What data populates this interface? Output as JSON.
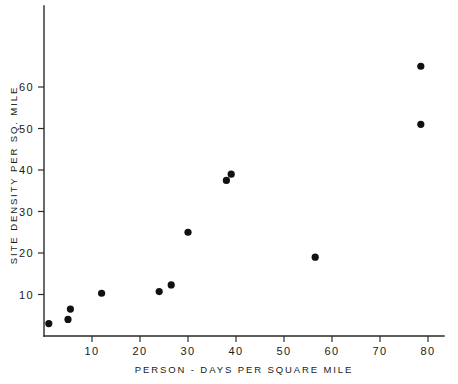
{
  "chart_data": {
    "type": "scatter",
    "title": "",
    "xlabel": "PERSON - DAYS  PER  SQUARE  MILE",
    "ylabel": "SITE  DENSITY  PER  SQ.  MILE",
    "xlim": [
      0,
      89
    ],
    "ylim": [
      0,
      70
    ],
    "xticks": [
      10,
      20,
      30,
      40,
      50,
      60,
      70,
      80
    ],
    "xtick_labels": [
      "10",
      "20",
      "30",
      "40",
      "50",
      "60",
      "70",
      "80"
    ],
    "yticks": [
      10,
      20,
      30,
      40,
      50,
      60
    ],
    "ytick_labels": [
      "10",
      "20",
      "30",
      "40",
      "50",
      "60"
    ],
    "grid": false,
    "legend": false,
    "marker": "filled-circle",
    "marker_color": "#111111",
    "points": [
      {
        "x": 1.0,
        "y": 3.0
      },
      {
        "x": 5.0,
        "y": 4.0
      },
      {
        "x": 5.5,
        "y": 6.5
      },
      {
        "x": 12.0,
        "y": 10.3
      },
      {
        "x": 24.0,
        "y": 10.7
      },
      {
        "x": 26.5,
        "y": 12.3
      },
      {
        "x": 30.0,
        "y": 25.0
      },
      {
        "x": 38.0,
        "y": 37.5
      },
      {
        "x": 39.0,
        "y": 39.0
      },
      {
        "x": 56.5,
        "y": 19.0
      },
      {
        "x": 78.5,
        "y": 51.0
      },
      {
        "x": 78.5,
        "y": 65.0
      }
    ]
  }
}
